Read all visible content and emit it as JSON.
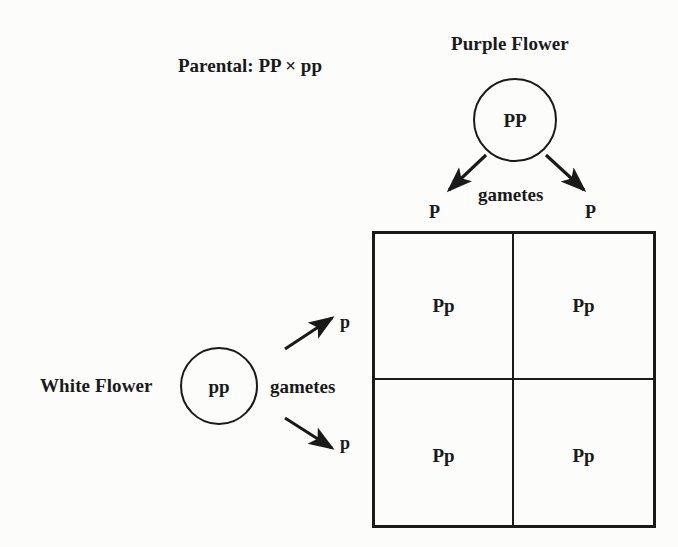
{
  "diagram": {
    "title_note": "Parental: PP × pp",
    "parents": {
      "purple": {
        "name": "Purple Flower",
        "genotype": "PP",
        "gametes_label": "gametes",
        "gametes": [
          "P",
          "P"
        ]
      },
      "white": {
        "name": "White Flower",
        "genotype": "pp",
        "gametes_label": "gametes",
        "gametes": [
          "p",
          "p"
        ]
      }
    },
    "punnett": {
      "col_headers": [
        "P",
        "P"
      ],
      "row_headers": [
        "p",
        "p"
      ],
      "cells": [
        [
          "Pp",
          "Pp"
        ],
        [
          "Pp",
          "Pp"
        ]
      ]
    },
    "colors": {
      "ink": "#1a1a1a",
      "page": "#fcfcfb"
    }
  }
}
